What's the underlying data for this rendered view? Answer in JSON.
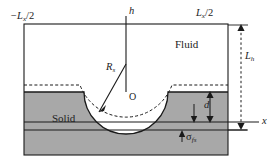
{
  "figure": {
    "type": "schematic-diagram",
    "colors": {
      "solid_fill": "#a8a8a8",
      "fluid_fill": "#ffffff",
      "line": "#1a1a1a",
      "background": "#ffffff"
    },
    "labels": {
      "left_boundary": {
        "base": "−L",
        "sub": "x",
        "tail": "/2"
      },
      "right_boundary": {
        "base": "L",
        "sub": "x",
        "tail": "/2"
      },
      "vertical_axis": "h",
      "horizontal_axis": "x",
      "fluid_region": "Fluid",
      "solid_region": "Solid",
      "cavity_radius": {
        "base": "R",
        "sub": "s"
      },
      "origin": "O",
      "box_height": {
        "base": "L",
        "sub": "h"
      },
      "depth": "d",
      "interface_thickness": {
        "base": "σ",
        "sub": "fs"
      }
    },
    "geometry": {
      "box": {
        "x0": 24,
        "y0": 24,
        "x1": 228,
        "y1": 155
      },
      "solid_top_y": 92,
      "cavity_center": {
        "x": 126,
        "y": 92
      },
      "cavity_radius_px": 42,
      "dashed_profile_offset_px": 7,
      "x_axis_y": 122,
      "sigma_line_y": 130,
      "h_axis_x": 126,
      "lh_measure_x": 241
    }
  }
}
